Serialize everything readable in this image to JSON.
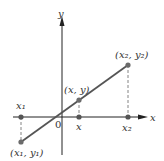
{
  "diagram": {
    "type": "coordinate-plane-line-segment",
    "colors": {
      "axis": "#222222",
      "segment": "#555555",
      "point": "#6b6b6b",
      "dashed": "#666666",
      "text": "#333333"
    },
    "axes": {
      "x_label": "x",
      "y_label": "y",
      "origin_label": "0"
    },
    "points": {
      "p1": {
        "label": "(x₁, y₁)"
      },
      "p2": {
        "label": "(x₂, y₂)"
      },
      "p": {
        "label": "(x, y)"
      }
    },
    "axis_ticks": {
      "x1": "x₁",
      "x": "x",
      "x2": "x₂"
    }
  }
}
